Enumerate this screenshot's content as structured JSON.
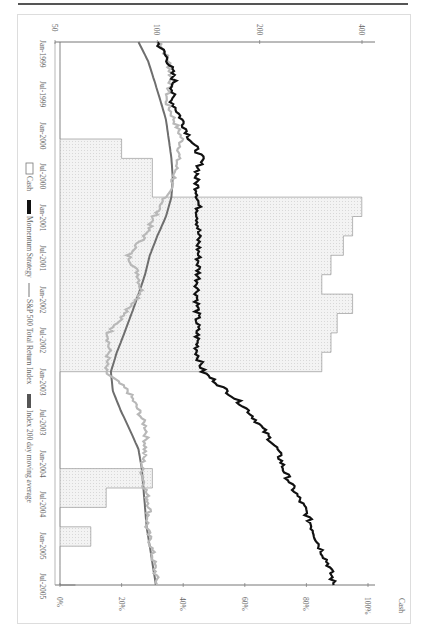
{
  "chart_data": {
    "type": "line",
    "orientation": "rotated-90-clockwise",
    "title": "",
    "xlabel": "",
    "ylabel_left": "",
    "ylabel_right": "Cash",
    "x_ticks": [
      "Jan-1999",
      "Jul-1999",
      "Jan-2000",
      "Jul-2000",
      "Jan-2001",
      "Jul-2001",
      "Jan-2002",
      "Jul-2002",
      "Jan-2003",
      "Jul-2003",
      "Jan-2004",
      "Jul-2004",
      "Jan-2005",
      "Jul-2005"
    ],
    "y_left_scale": "log",
    "y_left_ticks": [
      "50",
      "100",
      "200",
      "400"
    ],
    "y_left_range": [
      50,
      400
    ],
    "y_right_ticks": [
      "0%",
      "20%",
      "40%",
      "60%",
      "80%",
      "100%"
    ],
    "y_right_range": [
      0,
      100
    ],
    "grid": false,
    "legend": [
      "Cash",
      "Momentum Strategy",
      "S&P 500 Total Return Index",
      "Index 200 day moving average"
    ],
    "legend_position": "bottom",
    "x": [
      "Jan-1999",
      "Apr-1999",
      "Jul-1999",
      "Oct-1999",
      "Jan-2000",
      "Apr-2000",
      "Jul-2000",
      "Oct-2000",
      "Jan-2001",
      "Apr-2001",
      "Jul-2001",
      "Oct-2001",
      "Jan-2002",
      "Apr-2002",
      "Jul-2002",
      "Oct-2002",
      "Jan-2003",
      "Apr-2003",
      "Jul-2003",
      "Oct-2003",
      "Jan-2004",
      "Apr-2004",
      "Jul-2004",
      "Oct-2004",
      "Jan-2005",
      "Apr-2005",
      "Jul-2005",
      "Oct-2005",
      "Dec-2005"
    ],
    "series": [
      {
        "name": "Momentum Strategy",
        "axis": "left",
        "color": "#111111",
        "values": [
          100,
          108,
          112,
          110,
          118,
          125,
          135,
          130,
          132,
          132,
          132,
          132,
          132,
          131,
          131,
          131,
          131,
          136,
          160,
          185,
          205,
          225,
          235,
          250,
          270,
          285,
          300,
          320,
          330
        ]
      },
      {
        "name": "S&P 500 Total Return Index",
        "axis": "left",
        "color": "#bbbbbb",
        "values": [
          102,
          108,
          110,
          106,
          112,
          118,
          115,
          112,
          106,
          98,
          92,
          82,
          88,
          90,
          80,
          72,
          72,
          70,
          82,
          88,
          93,
          92,
          90,
          92,
          95,
          93,
          96,
          98,
          100
        ]
      },
      {
        "name": "Index 200 day moving average",
        "axis": "left",
        "color": "#777777",
        "values": [
          88,
          94,
          98,
          102,
          106,
          108,
          110,
          111,
          110,
          106,
          100,
          95,
          92,
          88,
          84,
          80,
          76,
          73,
          74,
          78,
          83,
          88,
          90,
          91,
          92,
          93,
          95,
          97,
          99
        ]
      },
      {
        "name": "Cash",
        "axis": "right",
        "color": "#cccccc",
        "values": [
          0,
          0,
          0,
          0,
          0,
          20,
          30,
          30,
          98,
          95,
          92,
          88,
          85,
          95,
          90,
          88,
          85,
          0,
          0,
          0,
          0,
          0,
          30,
          15,
          0,
          10,
          0,
          0,
          5
        ]
      }
    ]
  },
  "legend": {
    "cash": "Cash",
    "momentum": "Momentum Strategy",
    "index": "S&P 500 Total Return Index",
    "ma": "Index 200 day moving average"
  },
  "axis": {
    "right_title": "Cash",
    "left_ticks": [
      "50",
      "100",
      "200",
      "400"
    ],
    "right_ticks": [
      "0%",
      "20%",
      "40%",
      "60%",
      "80%",
      "100%"
    ],
    "x_ticks": [
      "Jan-1999",
      "Jul-1999",
      "Jan-2000",
      "Jul-2000",
      "Jan-2001",
      "Jul-2001",
      "Jan-2002",
      "Jul-2002",
      "Jan-2003",
      "Jul-2003",
      "Jan-2004",
      "Jul-2004",
      "Jan-2005",
      "Jul-2005"
    ]
  },
  "colors": {
    "momentum": "#111111",
    "index": "#b8b8b8",
    "ma": "#6e6e6e",
    "cash_fill": "#eeeeee",
    "cash_line": "#888888"
  }
}
